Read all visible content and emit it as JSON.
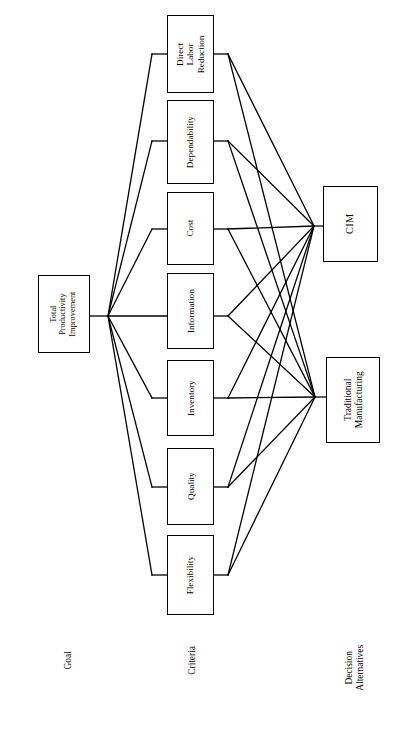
{
  "diagram": {
    "orientation": "rotated-90-clockwise",
    "line_color": "#000000",
    "box_border_color": "#000000",
    "background_color": "#ffffff",
    "goal": {
      "label": "Total\nProductivity\nImprovement",
      "line1": "Total",
      "line2": "Productivity",
      "line3": "Improvement"
    },
    "criteria": [
      {
        "label": "Direct\nLabor\nReduction",
        "line1": "Direct",
        "line2": "Labor",
        "line3": "Reduction"
      },
      {
        "label": "Dependability",
        "line1": "Dependability",
        "line2": "",
        "line3": ""
      },
      {
        "label": "Cost",
        "line1": "Cost",
        "line2": "",
        "line3": ""
      },
      {
        "label": "Information",
        "line1": "Information",
        "line2": "",
        "line3": ""
      },
      {
        "label": "Inventory",
        "line1": "Inventory",
        "line2": "",
        "line3": ""
      },
      {
        "label": "Quality",
        "line1": "Quality",
        "line2": "",
        "line3": ""
      },
      {
        "label": "Flexibility",
        "line1": "Flexibility",
        "line2": "",
        "line3": ""
      }
    ],
    "alternatives": [
      {
        "label": "CIM",
        "line1": "CIM",
        "line2": ""
      },
      {
        "label": "Traditional\nManufacturing",
        "line1": "Traditional",
        "line2": "Manufacturing"
      }
    ],
    "tier_labels": {
      "goal": "Goal",
      "criteria": "Criteria",
      "alternatives_line1": "Decision",
      "alternatives_line2": "Alternatives"
    }
  }
}
